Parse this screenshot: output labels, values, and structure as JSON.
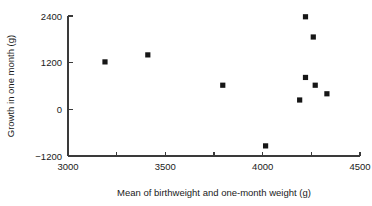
{
  "chart_data": {
    "type": "scatter",
    "title": "",
    "xlabel": "Mean of birthweight and one-month weight (g)",
    "ylabel": "Growth in one month (g)",
    "xlim": [
      3000,
      4500
    ],
    "ylim": [
      -1200,
      2400
    ],
    "grid": false,
    "legend": null,
    "x_ticks": [
      3000,
      3250,
      3500,
      3750,
      4000,
      4250,
      4500
    ],
    "x_tick_labels": [
      "3000",
      "",
      "3500",
      "",
      "4000",
      "",
      "4500"
    ],
    "y_ticks": [
      -1200,
      0,
      1200,
      2400
    ],
    "y_tick_labels": [
      "-1200",
      "0",
      "1200",
      "2400"
    ],
    "marker": "square",
    "marker_color": "#161616",
    "points": [
      {
        "x": 3190,
        "y": 1220
      },
      {
        "x": 3410,
        "y": 1400
      },
      {
        "x": 3795,
        "y": 620
      },
      {
        "x": 4015,
        "y": -940
      },
      {
        "x": 4220,
        "y": 2380
      },
      {
        "x": 4260,
        "y": 1860
      },
      {
        "x": 4220,
        "y": 820
      },
      {
        "x": 4270,
        "y": 620
      },
      {
        "x": 4330,
        "y": 400
      },
      {
        "x": 4190,
        "y": 240
      }
    ],
    "x": [
      3190,
      3410,
      3795,
      4015,
      4220,
      4260,
      4220,
      4270,
      4330,
      4190
    ],
    "values": [
      1220,
      1400,
      620,
      -940,
      2380,
      1860,
      820,
      620,
      400,
      240
    ]
  }
}
